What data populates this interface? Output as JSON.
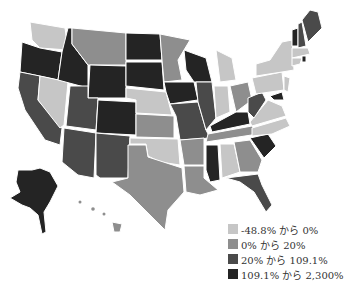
{
  "map": {
    "type": "choropleth",
    "region": "United States",
    "colors": {
      "c1": "#c6c6c6",
      "c2": "#8e8e8e",
      "c3": "#4a4a4a",
      "c4": "#242424"
    }
  },
  "legend": {
    "items": [
      {
        "label": "-48.8% から 0%",
        "color": "#c6c6c6"
      },
      {
        "label": "0% から 20%",
        "color": "#8e8e8e"
      },
      {
        "label": "20% から 109.1%",
        "color": "#4a4a4a"
      },
      {
        "label": "109.1% から 2,300%",
        "color": "#242424"
      }
    ]
  }
}
